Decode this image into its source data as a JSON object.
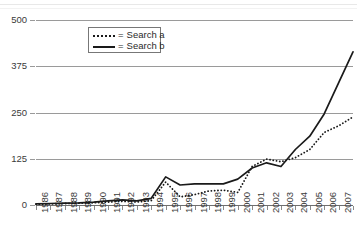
{
  "chart_data": {
    "type": "line",
    "title": "",
    "xlabel": "",
    "ylabel": "",
    "grid": true,
    "legend_position": "top-left-inside",
    "x": [
      1986,
      1987,
      1988,
      1989,
      1990,
      1991,
      1992,
      1993,
      1994,
      1995,
      1996,
      1997,
      1998,
      1999,
      2000,
      2001,
      2002,
      2003,
      2004,
      2005,
      2006,
      2007,
      2008
    ],
    "categories": [
      "1986",
      "1987",
      "1988",
      "1989",
      "1990",
      "1991",
      "1992",
      "1993",
      "1994",
      "1995",
      "1996",
      "1997",
      "1998",
      "1999",
      "2000",
      "2001",
      "2002",
      "2003",
      "2004",
      "2005",
      "2006",
      "2007",
      "2008"
    ],
    "xlim": [
      1986,
      2008
    ],
    "ylim": [
      0,
      500
    ],
    "yticks": [
      0,
      125,
      250,
      375,
      500
    ],
    "ytick_labels": [
      "0",
      "125",
      "250",
      "375",
      "500"
    ],
    "series": [
      {
        "name": "Search a",
        "style": "dotted",
        "color": "#1a1a1a",
        "values": [
          2,
          3,
          4,
          5,
          6,
          8,
          10,
          8,
          12,
          62,
          22,
          28,
          38,
          40,
          34,
          104,
          124,
          117,
          128,
          150,
          196,
          214,
          238
        ]
      },
      {
        "name": "Search b",
        "style": "solid",
        "color": "#1a1a1a",
        "values": [
          3,
          4,
          5,
          6,
          8,
          11,
          14,
          11,
          18,
          76,
          54,
          57,
          57,
          57,
          70,
          100,
          114,
          104,
          150,
          186,
          246,
          330,
          414
        ]
      }
    ]
  },
  "legend": {
    "entries": [
      {
        "prefix": "=",
        "label": "Search a",
        "swatch": "dotted-line-swatch"
      },
      {
        "prefix": "=",
        "label": "Search b",
        "swatch": "solid-line-swatch"
      }
    ]
  }
}
